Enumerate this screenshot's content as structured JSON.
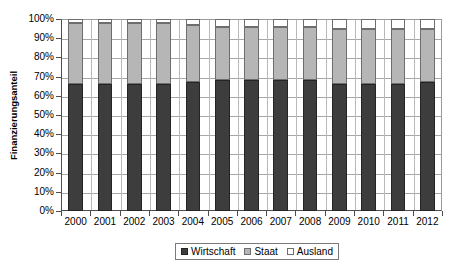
{
  "chart_data": {
    "type": "bar",
    "subtype": "stacked-100-percent",
    "title": "",
    "xlabel": "",
    "ylabel": "Finanzierungsanteil",
    "ylim": [
      0,
      100
    ],
    "ytick_labels": [
      "100%",
      "90%",
      "80%",
      "70%",
      "60%",
      "50%",
      "40%",
      "30%",
      "20%",
      "10%",
      "0%"
    ],
    "ytick_values": [
      100,
      90,
      80,
      70,
      60,
      50,
      40,
      30,
      20,
      10,
      0
    ],
    "grid": true,
    "legend_position": "bottom",
    "categories": [
      "2000",
      "2001",
      "2002",
      "2003",
      "2004",
      "2005",
      "2006",
      "2007",
      "2008",
      "2009",
      "2010",
      "2011",
      "2012"
    ],
    "series": [
      {
        "name": "Wirtschaft",
        "color": "#3d3d3d",
        "values": [
          66,
          66,
          66,
          66,
          67,
          68,
          68,
          68,
          68,
          66,
          66,
          66,
          67
        ]
      },
      {
        "name": "Staat",
        "color": "#b6b6b6",
        "values": [
          32,
          32,
          32,
          32,
          30,
          28,
          28,
          28,
          28,
          29,
          29,
          29,
          28
        ]
      },
      {
        "name": "Ausland",
        "color": "#ffffff",
        "values": [
          2,
          2,
          2,
          2,
          3,
          4,
          4,
          4,
          4,
          5,
          5,
          5,
          5
        ]
      }
    ]
  },
  "legend": {
    "items": [
      {
        "label": "Wirtschaft"
      },
      {
        "label": "Staat"
      },
      {
        "label": "Ausland"
      }
    ]
  },
  "axis": {
    "y_title": "Finanzierungsanteil"
  }
}
